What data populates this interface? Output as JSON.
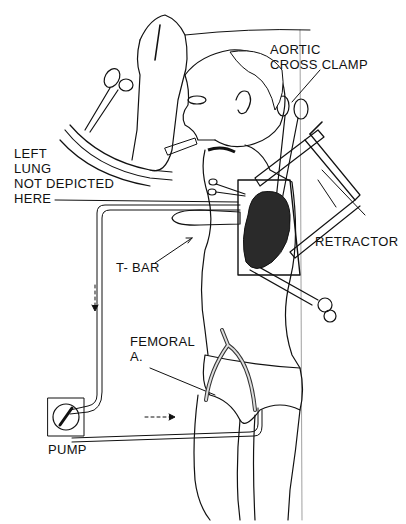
{
  "figure": {
    "type": "surgical illustration"
  },
  "labels": {
    "aortic_cross_clamp": "AORTIC\nCROSS CLAMP",
    "left_lung": "LEFT\nLUNG\nNOT DEPICTED\nHERE",
    "t_bar": "T- BAR",
    "retractor": "RETRACTOR",
    "femoral": "FEMORAL\nA.",
    "pump": "PUMP"
  },
  "flow_arrows": {
    "vertical": "downward dashed arrow",
    "horizontal": "rightward dashed arrow"
  },
  "colors": {
    "ink": "#111111",
    "background": "#ffffff",
    "heart_shade": "#2a2a2a"
  }
}
